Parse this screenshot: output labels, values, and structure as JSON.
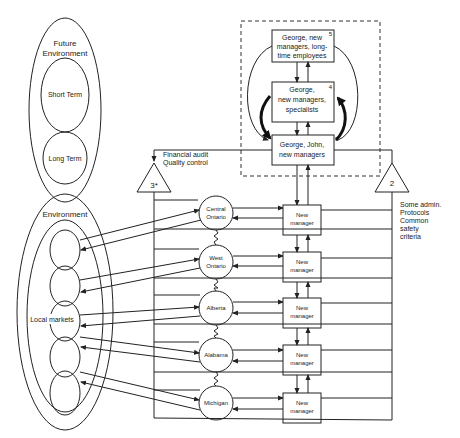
{
  "future_environment": {
    "title_line1": "Future",
    "title_line2": "Environment",
    "short_term": "Short Term",
    "long_term": "Long Term"
  },
  "environment": {
    "title": "Environment",
    "local_markets": "Local markets"
  },
  "top_boxes": [
    {
      "number": "5",
      "line1": "George, new",
      "line2": "managers, long-",
      "line3": "time employees"
    },
    {
      "number": "4",
      "line1": "George,",
      "line2": "new managers,",
      "line3": "specialists"
    },
    {
      "number": "3",
      "line1": "George, John,",
      "line2": "new managers",
      "line3": ""
    }
  ],
  "left_triangle": {
    "label": "3*",
    "note_line1": "Financial audit",
    "note_line2": "Quality control"
  },
  "right_triangle": {
    "label": "2",
    "note_lines": [
      "Some admin.",
      "Protocols",
      "Common",
      "safety",
      "criteria"
    ]
  },
  "regions": [
    {
      "name_line1": "Central",
      "name_line2": "Ontario",
      "manager_line1": "New",
      "manager_line2": "manager"
    },
    {
      "name_line1": "West",
      "name_line2": "Ontario",
      "manager_line1": "New",
      "manager_line2": "manager"
    },
    {
      "name_line1": "Alberta",
      "name_line2": "",
      "manager_line1": "New",
      "manager_line2": "manager"
    },
    {
      "name_line1": "Alabama",
      "name_line2": "",
      "manager_line1": "New",
      "manager_line2": "manager"
    },
    {
      "name_line1": "Michigan",
      "name_line2": "",
      "manager_line1": "New",
      "manager_line2": "manager"
    }
  ]
}
